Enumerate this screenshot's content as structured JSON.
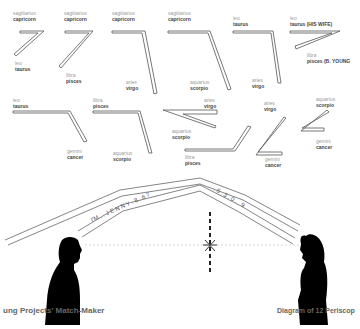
{
  "diagram": {
    "title_left": "ung Projects' Match-Maker",
    "title_right": "Diagram of 12 Periscop",
    "periscopes": [
      {
        "top_sign_a": "sagittarius",
        "top_sign_b": "capricorn",
        "bottom_sign_a": "leo",
        "bottom_sign_b": "taurus"
      },
      {
        "top_sign_a": "sagittarius",
        "top_sign_b": "capricorn",
        "bottom_sign_a": "libra",
        "bottom_sign_b": "pisces"
      },
      {
        "top_sign_a": "sagittarius",
        "top_sign_b": "capricorn",
        "bottom_sign_a": "aries",
        "bottom_sign_b": "virgo"
      },
      {
        "top_sign_a": "sagittarius",
        "top_sign_b": "capricorn",
        "bottom_sign_a": "aquarius",
        "bottom_sign_b": "scorpio"
      },
      {
        "top_sign_a": "leo",
        "top_sign_b": "taurus",
        "bottom_sign_a": "aries",
        "bottom_sign_b": "virgo"
      },
      {
        "top_sign_a": "leo",
        "top_sign_b": "taurus (HIS WIFE)",
        "bottom_sign_a": "libra",
        "bottom_sign_b": "pisces (B. YOUNG"
      },
      {
        "top_sign_a": "leo",
        "top_sign_b": "taurus",
        "bottom_sign_a": "gemini",
        "bottom_sign_b": "cancer"
      },
      {
        "top_sign_a": "libra",
        "top_sign_b": "pisces",
        "bottom_sign_a": "aquarius",
        "bottom_sign_b": "scorpio"
      },
      {
        "top_sign_a": "aries",
        "top_sign_b": "virgo",
        "bottom_sign_a": "aquarius",
        "bottom_sign_b": "scorpio"
      },
      {
        "top_sign_a": "libra",
        "top_sign_b": "pisces",
        "bottom_sign_a": "",
        "bottom_sign_b": ""
      },
      {
        "top_sign_a": "aries",
        "top_sign_b": "virgo",
        "bottom_sign_a": "gemini",
        "bottom_sign_b": "cancer"
      },
      {
        "top_sign_a": "aquarius",
        "top_sign_b": "scorpio",
        "bottom_sign_a": "gemini",
        "bottom_sign_b": "cancer"
      }
    ],
    "tube_text_left": "I'M . . J E N N Y . 8 . 6 7",
    "tube_text_right": ". 5 . 3 . 0 . . 9",
    "figures": {
      "left": "man-silhouette",
      "right": "woman-silhouette"
    },
    "center_marker": "x-marker"
  }
}
